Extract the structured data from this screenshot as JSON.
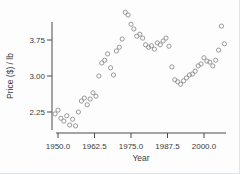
{
  "figure": {
    "background": "#fdfdfd",
    "axis_color": "#4a4a4a",
    "marker_color": "#8f8f8f",
    "text_color": "#3c3c3c"
  },
  "chart_data": {
    "type": "scatter",
    "title": "",
    "xlabel": "Year",
    "ylabel": "Price ($) / lb",
    "x_ticks": [
      1950.0,
      1962.5,
      1975.0,
      1987.5,
      2000.0
    ],
    "x_tick_labels": [
      "1950.0",
      "1962.5",
      "1975.0",
      "1987.5",
      "2000.0"
    ],
    "y_ticks": [
      2.25,
      3.0,
      3.75
    ],
    "y_tick_labels": [
      "2.25",
      "3.00",
      "3.75"
    ],
    "xlim": [
      1948.5,
      2008.5
    ],
    "ylim": [
      1.85,
      4.45
    ],
    "grid": false,
    "legend": "none",
    "marker": "open-circle",
    "points": [
      [
        1949,
        2.21
      ],
      [
        1950,
        2.29
      ],
      [
        1951,
        2.12
      ],
      [
        1952,
        2.06
      ],
      [
        1953,
        2.17
      ],
      [
        1954,
        1.98
      ],
      [
        1955,
        2.1
      ],
      [
        1956,
        1.96
      ],
      [
        1957,
        2.25
      ],
      [
        1958,
        2.48
      ],
      [
        1959,
        2.54
      ],
      [
        1960,
        2.4
      ],
      [
        1961,
        2.52
      ],
      [
        1962,
        2.65
      ],
      [
        1963,
        2.58
      ],
      [
        1964,
        3.0
      ],
      [
        1965,
        3.27
      ],
      [
        1966,
        3.33
      ],
      [
        1967,
        3.46
      ],
      [
        1968,
        3.17
      ],
      [
        1969,
        3.02
      ],
      [
        1970,
        3.52
      ],
      [
        1971,
        3.6
      ],
      [
        1972,
        3.77
      ],
      [
        1973,
        4.33
      ],
      [
        1974,
        4.27
      ],
      [
        1975,
        4.08
      ],
      [
        1976,
        3.98
      ],
      [
        1977,
        3.83
      ],
      [
        1978,
        3.87
      ],
      [
        1979,
        3.79
      ],
      [
        1980,
        3.65
      ],
      [
        1981,
        3.6
      ],
      [
        1982,
        3.63
      ],
      [
        1983,
        3.56
      ],
      [
        1984,
        3.69
      ],
      [
        1985,
        3.65
      ],
      [
        1986,
        3.73
      ],
      [
        1987,
        3.79
      ],
      [
        1988,
        3.62
      ],
      [
        1989,
        3.19
      ],
      [
        1990,
        2.92
      ],
      [
        1991,
        2.88
      ],
      [
        1992,
        2.83
      ],
      [
        1993,
        2.9
      ],
      [
        1994,
        2.96
      ],
      [
        1995,
        3.02
      ],
      [
        1996,
        3.04
      ],
      [
        1997,
        3.1
      ],
      [
        1998,
        3.21
      ],
      [
        1999,
        3.25
      ],
      [
        2000,
        3.38
      ],
      [
        2001,
        3.31
      ],
      [
        2002,
        3.29
      ],
      [
        2003,
        3.21
      ],
      [
        2004,
        3.33
      ],
      [
        2005,
        3.54
      ],
      [
        2006,
        4.04
      ],
      [
        2007,
        3.67
      ]
    ]
  }
}
